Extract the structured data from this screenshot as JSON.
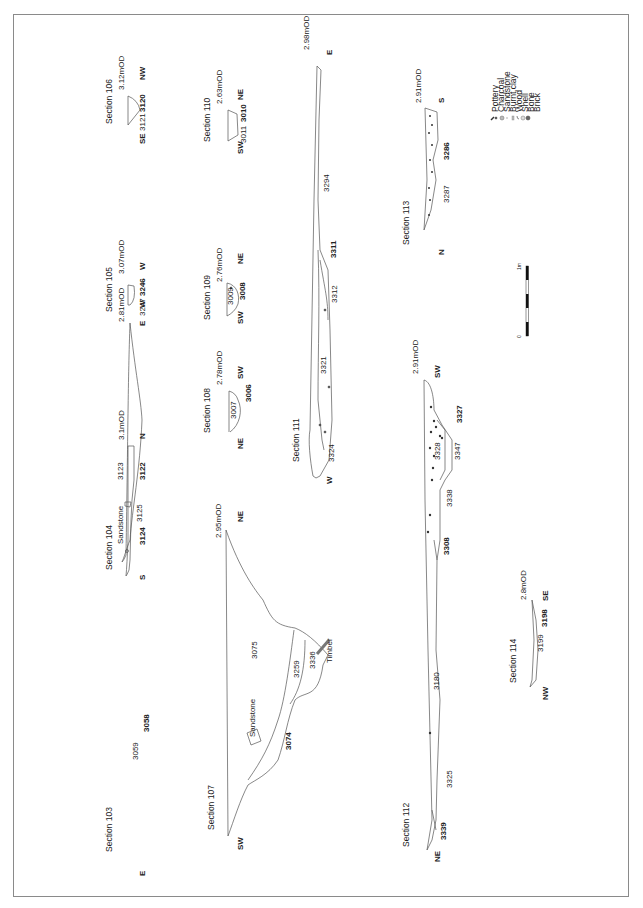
{
  "figure": {
    "type": "archaeological section drawings",
    "orientation": "rotated 90 degrees counter-clockwise"
  },
  "legend": {
    "items": [
      {
        "icon": "pottery-icon",
        "label": "Pottery"
      },
      {
        "icon": "charcoal-icon",
        "label": "Charcoal"
      },
      {
        "icon": "sandstone-icon",
        "label": "Sandstone"
      },
      {
        "icon": "burnt-clay-icon",
        "label": "Burnt clay"
      },
      {
        "icon": "wood-icon",
        "label": "Wood"
      },
      {
        "icon": "shell-icon",
        "label": "Shell"
      },
      {
        "icon": "bone-icon",
        "label": "Bone"
      },
      {
        "icon": "brick-icon",
        "label": "Brick"
      }
    ]
  },
  "scale_bar": {
    "start_label": "0",
    "end_label": "1m"
  },
  "sections": {
    "s103": {
      "title": "Section 103",
      "level": "2.81mOD",
      "dir_start": "E",
      "dir_end": "W",
      "contexts": [
        "3059"
      ],
      "cuts": [
        "3058"
      ]
    },
    "s104": {
      "title": "Section 104",
      "level": "3.1mOD",
      "dir_start": "S",
      "dir_end": "N",
      "contexts": [
        "3123",
        "3125"
      ],
      "cuts": [
        "3122",
        "3124"
      ],
      "notes": [
        "Sandstone"
      ]
    },
    "s105": {
      "title": "Section 105",
      "level": "3.07mOD",
      "dir_start": "E",
      "dir_end": "W",
      "contexts": [
        "3247"
      ],
      "cuts": [
        "3246"
      ]
    },
    "s106": {
      "title": "Section 106",
      "level": "3.12mOD",
      "dir_start": "SE",
      "dir_end": "NW",
      "contexts": [
        "3121"
      ],
      "cuts": [
        "3120"
      ]
    },
    "s107": {
      "title": "Section 107",
      "level": "2.95mOD",
      "dir_start": "SW",
      "dir_end": "NE",
      "contexts": [
        "3075",
        "3259",
        "3336"
      ],
      "cuts": [
        "3074"
      ],
      "notes": [
        "Sandstone",
        "Timber"
      ]
    },
    "s108": {
      "title": "Section 108",
      "level": "2.78mOD",
      "dir_start": "NE",
      "dir_end": "SW",
      "contexts": [
        "3007"
      ],
      "cuts": [
        "3006"
      ]
    },
    "s109": {
      "title": "Section 109",
      "level": "2.76mOD",
      "dir_start": "SW",
      "dir_end": "NE",
      "contexts": [
        "3009"
      ],
      "cuts": [
        "3008"
      ]
    },
    "s110": {
      "title": "Section 110",
      "level": "2.63mOD",
      "dir_start": "SW",
      "dir_end": "NE",
      "contexts": [
        "3011"
      ],
      "cuts": [
        "3010"
      ]
    },
    "s111": {
      "title": "Section 111",
      "level": "2.98mOD",
      "dir_start": "W",
      "dir_end": "E",
      "contexts": [
        "3324",
        "3321",
        "3312",
        "3294"
      ],
      "cuts": [
        "3311"
      ]
    },
    "s112": {
      "title": "Section 112",
      "level": "2.91mOD",
      "dir_start": "NE",
      "dir_end": "SW",
      "contexts": [
        "3325",
        "3180",
        "3338",
        "3328",
        "3347"
      ],
      "cuts": [
        "3339",
        "3308",
        "3327"
      ]
    },
    "s113": {
      "title": "Section 113",
      "level": "2.91mOD",
      "dir_start": "N",
      "dir_end": "S",
      "contexts": [
        "3287"
      ],
      "cuts": [
        "3286"
      ]
    },
    "s114": {
      "title": "Section 114",
      "level": "2.8mOD",
      "dir_start": "NW",
      "dir_end": "SE",
      "contexts": [
        "3199"
      ],
      "cuts": [
        "3198"
      ]
    }
  }
}
